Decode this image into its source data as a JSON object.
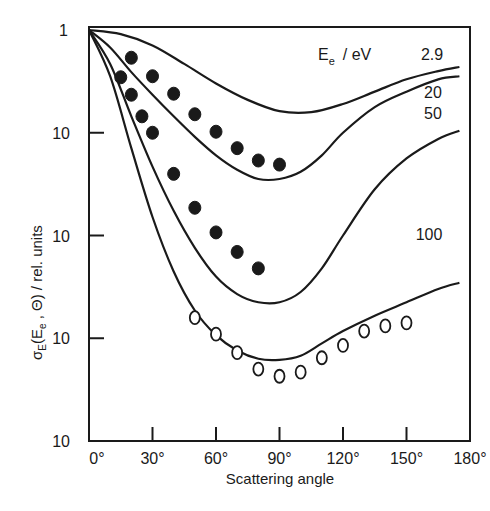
{
  "chart_data": {
    "type": "line",
    "title": "",
    "xlabel": "Scattering angle",
    "ylabel": "σE(Ee , Θ) / rel. units",
    "xlim": [
      0,
      180
    ],
    "ylim_decades": [
      -4,
      0
    ],
    "yscale": "log",
    "grid": false,
    "x_ticks": [
      "0°",
      "30°",
      "60°",
      "90°",
      "120°",
      "150°",
      "180°"
    ],
    "y_ticks": [
      "1",
      "10",
      "10",
      "10",
      "10"
    ],
    "legend_title": "Ee / eV",
    "series": [
      {
        "name": "2.9",
        "kind": "theory-curve",
        "curve": [
          [
            0,
            0
          ],
          [
            15,
            -0.04
          ],
          [
            30,
            -0.15
          ],
          [
            45,
            -0.33
          ],
          [
            60,
            -0.52
          ],
          [
            75,
            -0.68
          ],
          [
            90,
            -0.79
          ],
          [
            105,
            -0.8
          ],
          [
            120,
            -0.72
          ],
          [
            135,
            -0.6
          ],
          [
            150,
            -0.48
          ],
          [
            165,
            -0.4
          ],
          [
            175,
            -0.36
          ]
        ]
      },
      {
        "name": "20",
        "kind": "theory-curve",
        "curve": [
          [
            0,
            0
          ],
          [
            10,
            -0.17
          ],
          [
            20,
            -0.41
          ],
          [
            30,
            -0.63
          ],
          [
            40,
            -0.84
          ],
          [
            50,
            -1.04
          ],
          [
            60,
            -1.22
          ],
          [
            70,
            -1.36
          ],
          [
            80,
            -1.45
          ],
          [
            90,
            -1.45
          ],
          [
            100,
            -1.38
          ],
          [
            110,
            -1.22
          ],
          [
            120,
            -1.0
          ],
          [
            135,
            -0.75
          ],
          [
            150,
            -0.6
          ],
          [
            165,
            -0.48
          ],
          [
            175,
            -0.45
          ]
        ],
        "points": [
          [
            20,
            -0.27
          ],
          [
            30,
            -0.45
          ],
          [
            40,
            -0.62
          ],
          [
            50,
            -0.82
          ],
          [
            60,
            -0.99
          ],
          [
            70,
            -1.15
          ],
          [
            80,
            -1.27
          ],
          [
            90,
            -1.31
          ]
        ]
      },
      {
        "name": "50",
        "kind": "theory-curve",
        "curve": [
          [
            0,
            0
          ],
          [
            10,
            -0.33
          ],
          [
            20,
            -0.84
          ],
          [
            30,
            -1.33
          ],
          [
            40,
            -1.76
          ],
          [
            50,
            -2.12
          ],
          [
            60,
            -2.4
          ],
          [
            70,
            -2.57
          ],
          [
            80,
            -2.65
          ],
          [
            90,
            -2.65
          ],
          [
            100,
            -2.55
          ],
          [
            110,
            -2.32
          ],
          [
            120,
            -2.0
          ],
          [
            135,
            -1.55
          ],
          [
            150,
            -1.25
          ],
          [
            165,
            -1.06
          ],
          [
            175,
            -0.98
          ]
        ],
        "points": [
          [
            15,
            -0.46
          ],
          [
            20,
            -0.63
          ],
          [
            25,
            -0.84
          ],
          [
            30,
            -1.0
          ],
          [
            40,
            -1.4
          ],
          [
            50,
            -1.73
          ],
          [
            60,
            -1.97
          ],
          [
            70,
            -2.16
          ],
          [
            80,
            -2.32
          ]
        ]
      },
      {
        "name": "100",
        "kind": "theory-curve",
        "curve": [
          [
            0,
            0
          ],
          [
            10,
            -0.45
          ],
          [
            20,
            -1.15
          ],
          [
            30,
            -1.82
          ],
          [
            40,
            -2.35
          ],
          [
            50,
            -2.73
          ],
          [
            60,
            -2.97
          ],
          [
            70,
            -3.12
          ],
          [
            80,
            -3.2
          ],
          [
            90,
            -3.21
          ],
          [
            100,
            -3.17
          ],
          [
            110,
            -3.05
          ],
          [
            120,
            -2.93
          ],
          [
            135,
            -2.78
          ],
          [
            150,
            -2.65
          ],
          [
            165,
            -2.52
          ],
          [
            175,
            -2.46
          ]
        ],
        "points": [
          [
            50,
            -2.8
          ],
          [
            60,
            -2.96
          ],
          [
            70,
            -3.14
          ],
          [
            80,
            -3.3
          ],
          [
            90,
            -3.37
          ],
          [
            100,
            -3.33
          ],
          [
            110,
            -3.19
          ],
          [
            120,
            -3.07
          ],
          [
            130,
            -2.93
          ],
          [
            140,
            -2.88
          ],
          [
            150,
            -2.85
          ]
        ]
      }
    ],
    "curve_labels": [
      "2.9",
      "20",
      "50",
      "100"
    ]
  },
  "labels": {
    "legend_prefix": "E",
    "legend_sub": "e",
    "legend_unit": "/  eV",
    "ylabel_sigma": "σ",
    "ylabel_sigma_sub": "E",
    "ylabel_rest": "(E",
    "ylabel_e_sub": "e",
    "ylabel_tail": " , Θ)  /  rel. units"
  }
}
